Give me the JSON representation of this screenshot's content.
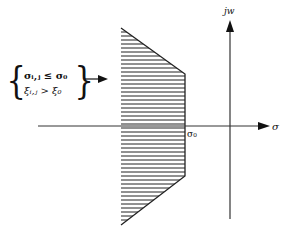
{
  "diagram": {
    "type": "s-plane region diagram",
    "axes": {
      "vertical_label": "jw",
      "horizontal_label": "σ",
      "origin_marker_label": "σ₀"
    },
    "condition": {
      "line1": "σᵢ,ⱼ ≤ σ₀",
      "line2": "ξᵢ,ⱼ > ξ₀"
    },
    "region": {
      "fill": "horizontal hatching",
      "shape": "trapezoid left of σ₀"
    },
    "colors": {
      "stroke": "#222222",
      "background": "#ffffff"
    }
  }
}
